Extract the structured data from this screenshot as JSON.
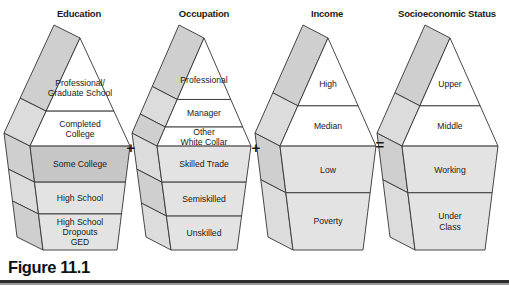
{
  "figure": {
    "caption": "Figure 11.1",
    "colors": {
      "outline": "#333333",
      "band_white": "#ffffff",
      "band_light": "#e3e3e3",
      "band_medium": "#c6c6c6",
      "side_face": "#cfcfcf",
      "side_face_light": "#dcdcdc",
      "text": "#1a1a1a"
    }
  },
  "operators": [
    {
      "symbol": "+",
      "x": 131,
      "y": 153
    },
    {
      "symbol": "+",
      "x": 256,
      "y": 153
    },
    {
      "symbol": "=",
      "x": 380,
      "y": 150
    }
  ],
  "pyramids": [
    {
      "id": "education",
      "title": "Education",
      "title_x": 79,
      "bands": [
        {
          "label": "Professional/\nGraduate School",
          "fill": "#ffffff"
        },
        {
          "label": "Completed\nCollege",
          "fill": "#ffffff"
        },
        {
          "label": "Some College",
          "fill": "#c6c6c6"
        },
        {
          "label": "High School",
          "fill": "#e3e3e3"
        },
        {
          "label": "High School\nDropouts\nGED",
          "fill": "#e3e3e3"
        }
      ]
    },
    {
      "id": "occupation",
      "title": "Occupation",
      "title_x": 204,
      "bands": [
        {
          "label": "Professional",
          "fill": "#ffffff"
        },
        {
          "label": "Manager",
          "fill": "#ffffff"
        },
        {
          "label": "Other\nWhite Collar",
          "fill": "#ffffff"
        },
        {
          "label": "Skilled Trade",
          "fill": "#e3e3e3"
        },
        {
          "label": "Semiskilled",
          "fill": "#e3e3e3"
        },
        {
          "label": "Unskilled",
          "fill": "#e3e3e3"
        }
      ]
    },
    {
      "id": "income",
      "title": "Income",
      "title_x": 327,
      "bands": [
        {
          "label": "High",
          "fill": "#ffffff"
        },
        {
          "label": "Median",
          "fill": "#ffffff"
        },
        {
          "label": "Low",
          "fill": "#e3e3e3"
        },
        {
          "label": "Poverty",
          "fill": "#e3e3e3"
        }
      ]
    },
    {
      "id": "socioeconomic-status",
      "title": "Socioeconomic Status",
      "title_x": 447,
      "bands": [
        {
          "label": "Upper",
          "fill": "#ffffff"
        },
        {
          "label": "Middle",
          "fill": "#ffffff"
        },
        {
          "label": "Working",
          "fill": "#e3e3e3"
        },
        {
          "label": "Under\nClass",
          "fill": "#e3e3e3"
        }
      ]
    }
  ],
  "chart_data": {
    "type": "diagram",
    "title": "Figure 11.1",
    "equation": "Education + Occupation + Income = Socioeconomic Status",
    "pyramids": [
      {
        "name": "Education",
        "strata_top_to_bottom": [
          "Professional/Graduate School",
          "Completed College",
          "Some College",
          "High School",
          "High School Dropouts GED"
        ]
      },
      {
        "name": "Occupation",
        "strata_top_to_bottom": [
          "Professional",
          "Manager",
          "Other White Collar",
          "Skilled Trade",
          "Semiskilled",
          "Unskilled"
        ]
      },
      {
        "name": "Income",
        "strata_top_to_bottom": [
          "High",
          "Median",
          "Low",
          "Poverty"
        ]
      },
      {
        "name": "Socioeconomic Status",
        "strata_top_to_bottom": [
          "Upper",
          "Middle",
          "Working",
          "Under Class"
        ]
      }
    ]
  }
}
